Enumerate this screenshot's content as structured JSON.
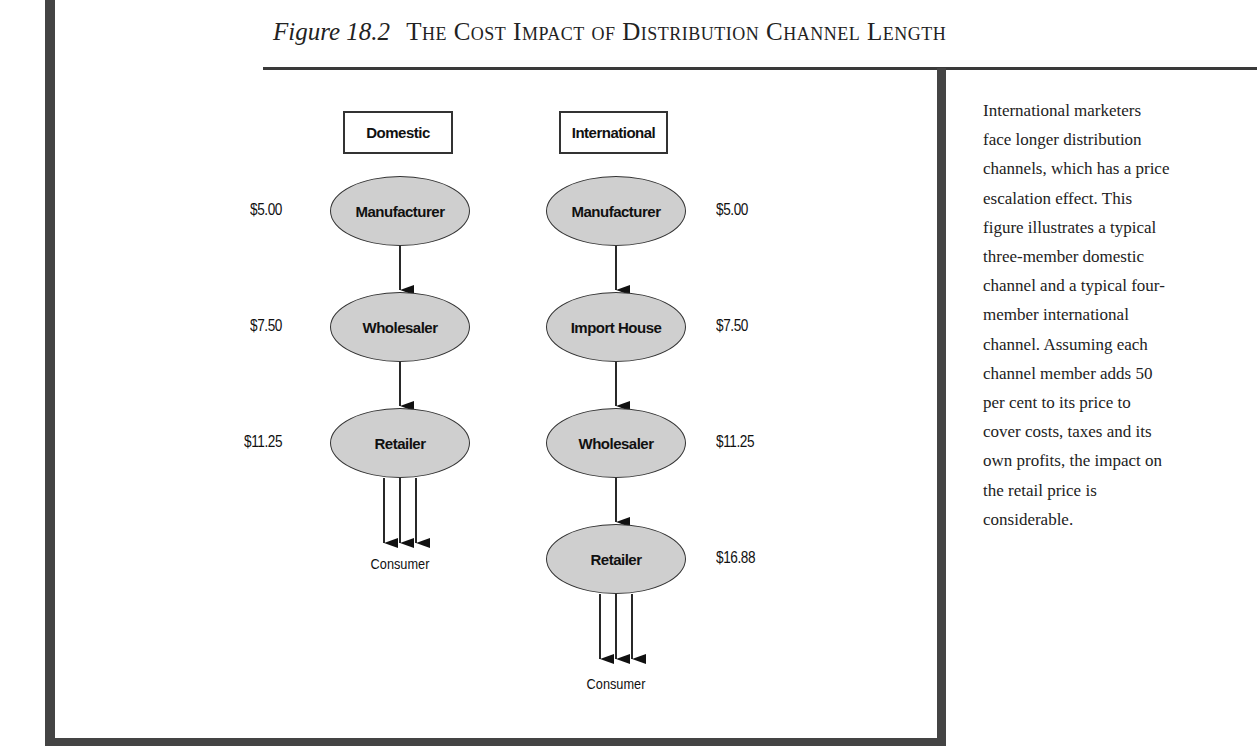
{
  "figure": {
    "number": "Figure 18.2",
    "title": "The Cost Impact of Distribution Channel Length"
  },
  "diagram": {
    "domestic": {
      "header": "Domestic",
      "members": [
        {
          "name": "Manufacturer",
          "price": "$5.00"
        },
        {
          "name": "Wholesaler",
          "price": "$7.50"
        },
        {
          "name": "Retailer",
          "price": "$11.25"
        }
      ],
      "end": "Consumer"
    },
    "international": {
      "header": "International",
      "members": [
        {
          "name": "Manufacturer",
          "price": "$5.00"
        },
        {
          "name": "Import House",
          "price": "$7.50"
        },
        {
          "name": "Wholesaler",
          "price": "$11.25"
        },
        {
          "name": "Retailer",
          "price": "$16.88"
        }
      ],
      "end": "Consumer"
    }
  },
  "caption": "International marketers\nface longer distribution\nchannels, which has a price\nescalation effect. This\nfigure illustrates a typical\nthree-member domestic\nchannel and a typical four-\nmember international\nchannel. Assuming each\nchannel member adds 50\nper cent to its price to\ncover costs, taxes and its\nown profits, the impact on\nthe retail price is\nconsiderable.",
  "colors": {
    "node_fill": "#cfcfcf",
    "frame": "#444444"
  }
}
